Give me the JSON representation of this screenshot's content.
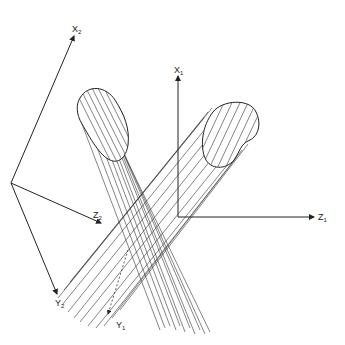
{
  "diagram": {
    "type": "two intersecting cylinders with coordinate frames",
    "frame1": {
      "x_axis_label": "X",
      "x_axis_sub": "1",
      "y_axis_label": "Y",
      "y_axis_sub": "1",
      "z_axis_label": "Z",
      "z_axis_sub": "1"
    },
    "frame2": {
      "x_axis_label": "X",
      "x_axis_sub": "2",
      "y_axis_label": "Y",
      "y_axis_sub": "2",
      "z_axis_label": "Z",
      "z_axis_sub": "2"
    },
    "colors": {
      "line": "#222222",
      "background": "#ffffff"
    }
  }
}
